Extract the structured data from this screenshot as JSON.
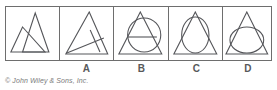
{
  "figure": {
    "kind": "multiple-choice-geometry-figure",
    "credit": "© John Wiley & Sons, Inc.",
    "stroke_color": "#55565a",
    "frame_color": "#6e6e6e",
    "background_color": "#ffffff",
    "label_color": "#58595b",
    "panels": [
      {
        "id": "panel-prompt",
        "label": "",
        "description": "Two overlapping outlined triangles: a tall narrow triangle on the upper right and a wider triangle on the lower left, their edges crossing."
      },
      {
        "id": "panel-a",
        "label": "A",
        "description": "Large triangle with a line from the lower-left vertex to the right side and a short line crossing it."
      },
      {
        "id": "panel-b",
        "label": "B",
        "description": "Triangle with a circle shifted right that extends past the base, plus a horizontal chord line."
      },
      {
        "id": "panel-c",
        "label": "C",
        "description": "Triangle with a tall vertical ellipse inscribed, touching the base."
      },
      {
        "id": "panel-d",
        "label": "D",
        "description": "Triangle with a wide ellipse resting on the base."
      }
    ],
    "labels": [
      "",
      "A",
      "B",
      "C",
      "D"
    ]
  }
}
